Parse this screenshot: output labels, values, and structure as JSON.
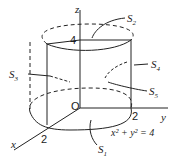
{
  "figure": {
    "type": "cylinder-surfaces",
    "axes": {
      "x": "x",
      "y": "y",
      "z": "z",
      "origin": "O"
    },
    "ticks": {
      "x": "2",
      "y": "2",
      "z": "4"
    },
    "equation": "x² + y² = 4",
    "surfaces": [
      {
        "name": "S",
        "sub": "1"
      },
      {
        "name": "S",
        "sub": "2"
      },
      {
        "name": "S",
        "sub": "3"
      },
      {
        "name": "S",
        "sub": "4"
      },
      {
        "name": "S",
        "sub": "5"
      }
    ]
  }
}
